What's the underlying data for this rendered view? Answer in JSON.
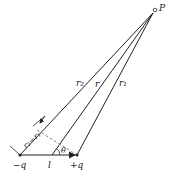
{
  "diagram": {
    "type": "electric-dipole-geometry",
    "colors": {
      "line": "#222222",
      "dashed": "#888888",
      "background": "#ffffff"
    },
    "points": {
      "P": {
        "label": "P",
        "x": 153,
        "y": 13
      },
      "neg_charge": {
        "label": "−q",
        "x": 20,
        "y": 155
      },
      "pos_charge": {
        "label": "+q",
        "x": 77,
        "y": 155
      },
      "center": {
        "x": 52,
        "y": 155
      }
    },
    "labels": {
      "point_p": "P",
      "r2": "r₂",
      "r": "r",
      "r1": "r₁",
      "path_difference": "r₂−r₁",
      "theta": "θ",
      "separation": "l",
      "neg_charge": "−q",
      "pos_charge": "+q"
    }
  }
}
